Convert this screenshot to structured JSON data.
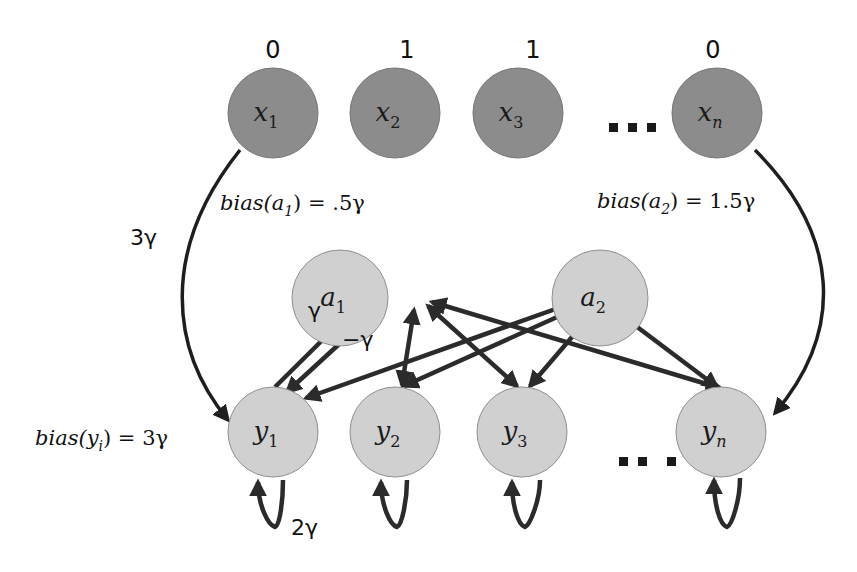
{
  "colors": {
    "input_node": "#8c8c8c",
    "input_stroke": "#777777",
    "hidden_node": "#d0d0d0",
    "hidden_stroke": "#8f8f8f",
    "edge": "#2b2b2b",
    "background": "#ffffff"
  },
  "input_layer": {
    "nodes": [
      {
        "name": "x",
        "sub": "1",
        "value": "0"
      },
      {
        "name": "x",
        "sub": "2",
        "value": "1"
      },
      {
        "name": "x",
        "sub": "3",
        "value": "1"
      },
      {
        "name": "x",
        "sub": "n",
        "value": "0"
      }
    ],
    "ellipsis": "..."
  },
  "auxiliary_layer": {
    "nodes": [
      {
        "name": "a",
        "sub": "1",
        "bias_text": "bias(a",
        "bias_sub": "1",
        "bias_value": ")  = .5γ"
      },
      {
        "name": "a",
        "sub": "2",
        "bias_text": "bias(a",
        "bias_sub": "2",
        "bias_value": ")  = 1.5γ"
      }
    ]
  },
  "output_layer": {
    "nodes": [
      {
        "name": "y",
        "sub": "1"
      },
      {
        "name": "y",
        "sub": "2"
      },
      {
        "name": "y",
        "sub": "3"
      },
      {
        "name": "y",
        "sub": "n"
      }
    ],
    "ellipsis": "...",
    "bias_text": "bias(y",
    "bias_sub": "i",
    "bias_value": ") = 3γ"
  },
  "weights": {
    "input_to_output": "3γ",
    "output_to_aux": "γ",
    "aux_to_output": "−γ",
    "self_loop": "2γ"
  }
}
